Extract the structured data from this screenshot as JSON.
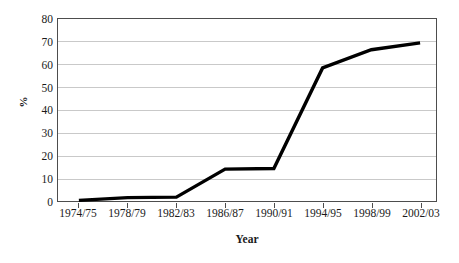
{
  "chart_data": {
    "type": "line",
    "title": "",
    "xlabel": "Year",
    "ylabel": "%",
    "ylim": [
      0,
      80
    ],
    "ytick_labels": [
      "80",
      "70",
      "60",
      "50",
      "40",
      "30",
      "20",
      "10",
      "0"
    ],
    "ytick_values": [
      80,
      70,
      60,
      50,
      40,
      30,
      20,
      10,
      0
    ],
    "grid": "horizontal",
    "legend": "none",
    "line_color": "#000000",
    "line_width_px": 3,
    "categories": [
      "1974/75",
      "1978/79",
      "1982/83",
      "1986/87",
      "1990/91",
      "1994/95",
      "1998/99",
      "2002/03"
    ],
    "tick_labels": [
      "1974/75",
      "1978/79",
      "1982/83",
      "1986/87",
      "1990/91",
      "1994/95",
      "1998/99",
      "2002/03"
    ],
    "values": [
      0.3,
      1.5,
      1.7,
      14.0,
      14.3,
      58.5,
      66.5,
      69.5
    ],
    "series": [
      {
        "name": "",
        "values": [
          0.3,
          1.5,
          1.7,
          14.0,
          14.3,
          58.5,
          66.5,
          69.5
        ]
      }
    ],
    "annotations": []
  }
}
